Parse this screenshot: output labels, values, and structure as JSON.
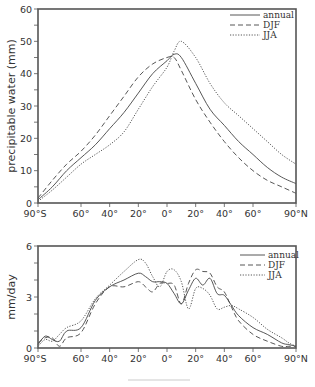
{
  "chart_data": [
    {
      "type": "line",
      "title": "",
      "xlabel": "",
      "ylabel": "precipitable water (mm)",
      "ylim": [
        0,
        60
      ],
      "xlim": [
        -90,
        90
      ],
      "yticks": [
        0,
        10,
        20,
        30,
        40,
        50,
        60
      ],
      "xtick_labels": [
        "90°S",
        "60°",
        "40°",
        "20°",
        "0°",
        "20°",
        "40°",
        "60°",
        "90°N"
      ],
      "grid": false,
      "legend_position": "upper right",
      "x": [
        -90,
        -80,
        -70,
        -60,
        -50,
        -40,
        -30,
        -20,
        -10,
        0,
        5,
        10,
        20,
        30,
        40,
        50,
        60,
        70,
        80,
        90
      ],
      "series": [
        {
          "name": "annual",
          "style": "solid",
          "values": [
            1,
            5,
            10,
            14,
            18,
            23,
            28,
            34,
            40,
            44,
            46,
            45,
            37,
            29,
            24,
            19,
            15,
            11,
            8,
            6
          ]
        },
        {
          "name": "DJF",
          "style": "dashed",
          "values": [
            1.5,
            7,
            12,
            16,
            21,
            27,
            33,
            39,
            43,
            45,
            45,
            41,
            32,
            25,
            19,
            14,
            10,
            7,
            5,
            3
          ]
        },
        {
          "name": "JJA",
          "style": "dotted",
          "values": [
            0.5,
            4,
            8,
            12,
            15,
            18,
            22,
            29,
            36,
            42,
            47,
            50,
            45,
            37,
            31,
            27,
            23,
            19,
            15,
            12
          ]
        }
      ]
    },
    {
      "type": "line",
      "title": "",
      "xlabel": "",
      "ylabel": "mm/day",
      "ylim": [
        0,
        6
      ],
      "xlim": [
        -90,
        90
      ],
      "yticks": [
        0,
        3,
        6
      ],
      "xtick_labels": [
        "90°S",
        "60°",
        "40°",
        "20°",
        "0°",
        "20°",
        "40°",
        "60°",
        "90°N"
      ],
      "grid": false,
      "legend_position": "upper right",
      "x": [
        -90,
        -85,
        -80,
        -75,
        -70,
        -60,
        -50,
        -40,
        -30,
        -20,
        -15,
        -10,
        -5,
        0,
        5,
        10,
        15,
        20,
        25,
        30,
        35,
        40,
        45,
        50,
        60,
        70,
        80,
        85,
        90
      ],
      "series": [
        {
          "name": "annual",
          "style": "solid",
          "values": [
            0.2,
            0.7,
            0.5,
            0.4,
            1.0,
            1.2,
            2.8,
            3.6,
            4.0,
            4.4,
            4.2,
            3.9,
            3.9,
            3.8,
            3.2,
            2.6,
            3.4,
            4.1,
            3.7,
            4.1,
            3.2,
            3.1,
            2.5,
            1.9,
            1.2,
            0.8,
            0.3,
            0.2,
            0.1
          ]
        },
        {
          "name": "DJF",
          "style": "dashed",
          "values": [
            0.3,
            0.6,
            0.6,
            0.1,
            0.6,
            0.9,
            2.6,
            3.6,
            3.6,
            3.9,
            3.6,
            3.3,
            3.8,
            3.8,
            3.7,
            2.6,
            3.8,
            4.6,
            4.5,
            4.4,
            3.6,
            3.3,
            2.4,
            1.6,
            0.8,
            0.4,
            0.1,
            0.1,
            0.1
          ]
        },
        {
          "name": "JJA",
          "style": "dotted",
          "values": [
            0.1,
            0.5,
            0.4,
            0.8,
            1.2,
            1.6,
            2.9,
            3.7,
            4.5,
            5.2,
            5.0,
            4.2,
            3.6,
            4.5,
            4.6,
            3.9,
            2.3,
            3.5,
            3.5,
            3.1,
            2.3,
            2.4,
            2.5,
            2.3,
            1.8,
            1.1,
            0.6,
            0.3,
            0.1
          ]
        }
      ]
    }
  ],
  "top_chart": {
    "ylabel": "precipitable water (mm)",
    "yticks": [
      "0",
      "10",
      "20",
      "30",
      "40",
      "50",
      "60"
    ],
    "xticks": [
      "90°S",
      "60°",
      "40°",
      "20°",
      "0°",
      "20°",
      "40°",
      "60°",
      "90°N"
    ],
    "legend": [
      "annual",
      "DJF",
      "JJA"
    ]
  },
  "bottom_chart": {
    "ylabel": "mm/day",
    "yticks": [
      "0",
      "3",
      "6"
    ],
    "xticks": [
      "90°S",
      "60°",
      "40°",
      "20°",
      "0°",
      "20°",
      "40°",
      "60°",
      "90°N"
    ],
    "legend": [
      "annual",
      "DJF",
      "JJA"
    ]
  },
  "styles": {
    "line_color": "#444444",
    "frame_color": "#555555",
    "text_color": "#333333",
    "footer_line_color": "#dddddd"
  }
}
